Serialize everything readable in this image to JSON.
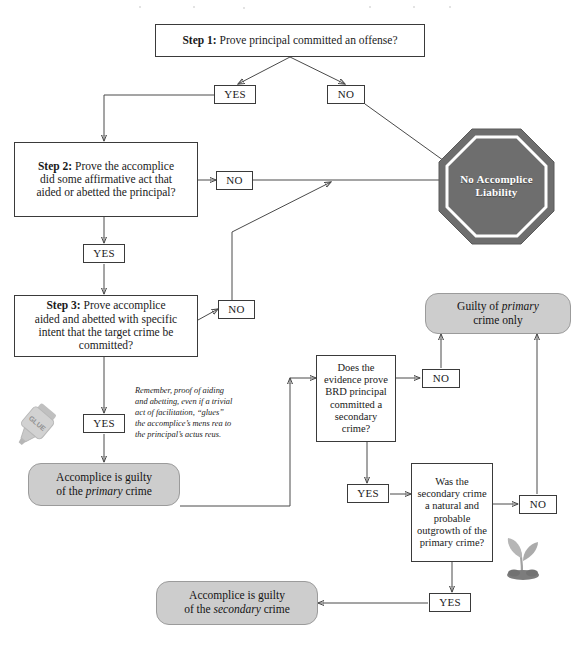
{
  "page": {
    "width": 583,
    "height": 647,
    "background": "#ffffff"
  },
  "colors": {
    "line": "#4a4a4a",
    "box_border": "#3a3a3a",
    "box_fill": "#ffffff",
    "pill_fill": "#cdcdcd",
    "pill_border": "#9b9b9b",
    "octagon_fill": "#6e6e6e",
    "octagon_ring": "#ffffff",
    "octagon_text": "#ffffff",
    "text": "#1a1a1a"
  },
  "nodes": {
    "step1": {
      "label_prefix": "Step 1:",
      "text": " Prove principal committed an offense?"
    },
    "step1_yes": {
      "label": "YES"
    },
    "step1_no": {
      "label": "NO"
    },
    "step2": {
      "label_prefix": "Step 2:",
      "line1": " Prove the accomplice",
      "line2": "did some affirmative act that",
      "line3": "aided or abetted the principal?"
    },
    "step2_no": {
      "label": "NO"
    },
    "step2_yes": {
      "label": "YES"
    },
    "step3": {
      "label_prefix": "Step 3:",
      "line1": " Prove accomplice",
      "line2": "aided and abetted with specific",
      "line3": "intent that the target crime be",
      "line4": "committed?"
    },
    "step3_no": {
      "label": "NO"
    },
    "step3_yes": {
      "label": "YES"
    },
    "no_liability": {
      "line1": "No Accomplice",
      "line2": "Liability"
    },
    "note": {
      "line1": "Remember, proof of aiding",
      "line2": "and abetting, even if a trivial",
      "line3": "act of facilitation, “glues”",
      "line4": "the accomplice’s mens rea to",
      "line5": "the principal’s actus reus."
    },
    "primary_guilty": {
      "line1": "Accomplice is guilty",
      "line2_pre": "of the ",
      "line2_em": "primary",
      "line2_post": " crime"
    },
    "guilty_primary_only": {
      "line1_pre": "Guilty of ",
      "line1_em": "primary",
      "line2": "crime only"
    },
    "brd_question": {
      "line1": "Does the",
      "line2": "evidence prove",
      "line3": "BRD principal",
      "line4": "committed a",
      "line5": "secondary crime?"
    },
    "brd_no": {
      "label": "NO"
    },
    "brd_yes": {
      "label": "YES"
    },
    "natural_probable": {
      "line1": "Was the",
      "line2": "secondary crime",
      "line3": "a natural and",
      "line4": "probable",
      "line5": "outgrowth of the",
      "line6": "primary crime?"
    },
    "np_no": {
      "label": "NO"
    },
    "np_yes": {
      "label": "YES"
    },
    "secondary_guilty": {
      "line1": "Accomplice is guilty",
      "line2_pre": "of the ",
      "line2_em": "secondary",
      "line2_post": " crime"
    }
  },
  "decorations": {
    "glue_bottle": {
      "icon": "glue-bottle-icon",
      "label": "GLUE"
    },
    "seedling": {
      "icon": "seedling-icon"
    }
  }
}
